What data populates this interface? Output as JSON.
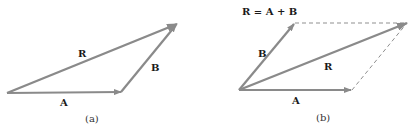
{
  "colors": {
    "vector": "#8a8a8a",
    "dashed": "#8f8f8f",
    "text": "#1a1a1a"
  },
  "panel_a": {
    "caption": "(a)",
    "vectors": [
      {
        "name": "A",
        "label": "A",
        "from": [
          7,
          93
        ],
        "to": [
          121,
          92
        ]
      },
      {
        "name": "B",
        "label": "B",
        "from": [
          121,
          92
        ],
        "to": [
          177,
          24
        ]
      },
      {
        "name": "R",
        "label": "R",
        "from": [
          7,
          93
        ],
        "to": [
          177,
          24
        ]
      }
    ]
  },
  "panel_b": {
    "caption": "(b)",
    "equation": "R = A + B",
    "vectors": [
      {
        "name": "A",
        "label": "A",
        "from": [
          239,
          90
        ],
        "to": [
          351,
          90
        ]
      },
      {
        "name": "B",
        "label": "B",
        "from": [
          239,
          90
        ],
        "to": [
          294,
          24
        ]
      },
      {
        "name": "R",
        "label": "R",
        "from": [
          239,
          90
        ],
        "to": [
          407,
          23
        ]
      }
    ],
    "dashed_lines": [
      {
        "from": [
          294,
          23
        ],
        "to": [
          407,
          23
        ]
      },
      {
        "from": [
          351,
          90
        ],
        "to": [
          407,
          23
        ]
      }
    ]
  }
}
